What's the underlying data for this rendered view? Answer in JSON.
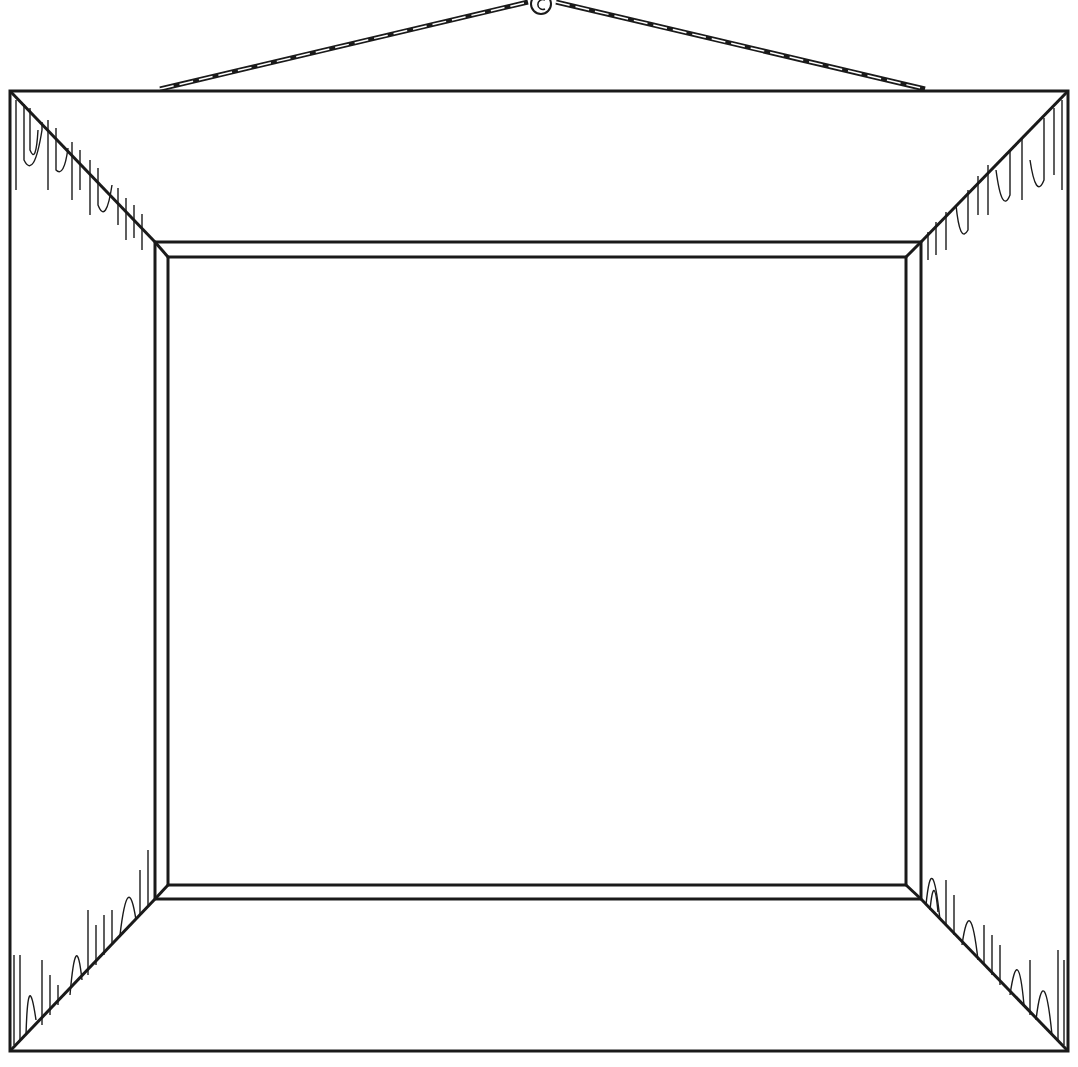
{
  "illustration": {
    "subject": "empty picture frame line drawing",
    "stroke_color": "#1a1a1a",
    "background_color": "#ffffff"
  }
}
